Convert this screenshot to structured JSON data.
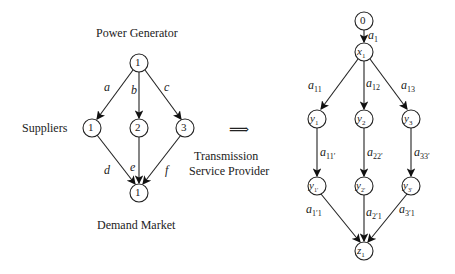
{
  "left": {
    "title_top": "Power Generator",
    "label_left": "Suppliers",
    "label_right_1": "Transmission",
    "label_right_2": "Service Provider",
    "title_bottom": "Demand Market",
    "nodes": {
      "top": "1",
      "s1": "1",
      "s2": "2",
      "s3": "3",
      "bottom": "1"
    },
    "edges": {
      "a": "a",
      "b": "b",
      "c": "c",
      "d": "d",
      "e": "e",
      "f": "f"
    }
  },
  "arrow": "⟹",
  "right": {
    "nodes": {
      "n0": "0",
      "x1": "x",
      "x1s": "1",
      "y1": "y",
      "y1s": "1",
      "y2": "y",
      "y2s": "2",
      "y3": "y",
      "y3s": "3",
      "y1p": "y",
      "y1ps": "1′",
      "y2p": "y",
      "y2ps": "2′",
      "y3p": "y",
      "y3ps": "3′",
      "z1": "z",
      "z1s": "1"
    },
    "edges": {
      "a1": "a",
      "a1s": "1",
      "a11": "a",
      "a11s": "11",
      "a12": "a",
      "a12s": "12",
      "a13": "a",
      "a13s": "13",
      "a111": "a",
      "a111s": "11′",
      "a222": "a",
      "a222s": "22′",
      "a333": "a",
      "a333s": "33′",
      "a1p1": "a",
      "a1p1s": "1′1",
      "a2p1": "a",
      "a2p1s": "2′1",
      "a3p1": "a",
      "a3p1s": "3′1"
    }
  }
}
